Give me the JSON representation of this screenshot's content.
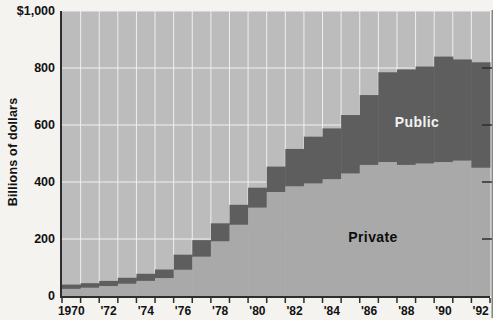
{
  "chart_data": {
    "type": "area",
    "subtype": "stacked-step-no-gaps",
    "title": "",
    "ylabel": "Billions of dollars",
    "xlabel": "",
    "ylim": [
      0,
      1000
    ],
    "grid": true,
    "legend_position": "labels-inside-areas",
    "x": [
      1970,
      1971,
      1972,
      1973,
      1974,
      1975,
      1976,
      1977,
      1978,
      1979,
      1980,
      1981,
      1982,
      1983,
      1984,
      1985,
      1986,
      1987,
      1988,
      1989,
      1990,
      1991,
      1992
    ],
    "series": [
      {
        "name": "Private",
        "values": [
          25,
          29,
          35,
          43,
          53,
          63,
          92,
          138,
          192,
          250,
          310,
          365,
          385,
          395,
          410,
          430,
          460,
          470,
          460,
          465,
          470,
          475,
          450
        ]
      },
      {
        "name": "Public",
        "values": [
          15,
          16,
          18,
          21,
          25,
          30,
          53,
          58,
          63,
          70,
          70,
          89,
          131,
          164,
          178,
          205,
          245,
          315,
          335,
          340,
          370,
          355,
          370
        ]
      }
    ],
    "totals": [
      40,
      45,
      53,
      64,
      78,
      93,
      145,
      196,
      255,
      320,
      380,
      454,
      516,
      559,
      588,
      635,
      705,
      785,
      795,
      805,
      840,
      830,
      820
    ],
    "y_ticks": [
      0,
      200,
      400,
      600,
      800,
      1000
    ],
    "y_tick_labels": [
      "0",
      "200",
      "400",
      "600",
      "800",
      "$1,000"
    ],
    "x_tick_years": [
      1970,
      1972,
      1974,
      1976,
      1978,
      1980,
      1982,
      1984,
      1986,
      1988,
      1990,
      1992
    ],
    "x_tick_labels": [
      "1970",
      "'72",
      "'74",
      "'76",
      "'78",
      "'80",
      "'82",
      "'84",
      "'86",
      "'88",
      "'90",
      "'92"
    ],
    "colors": {
      "page_bg": "#f4f3f0",
      "plot_bg": "#bcbcbc",
      "private_fill": "#a9a9a9",
      "public_fill": "#5e5e5e",
      "gridline": "#efefef",
      "axis": "#2e2e2e",
      "text": "#111111",
      "public_label_text": "#f2f2f2",
      "private_label_text": "#0d0d0d"
    }
  },
  "labels": {
    "public": "Public",
    "private": "Private"
  }
}
